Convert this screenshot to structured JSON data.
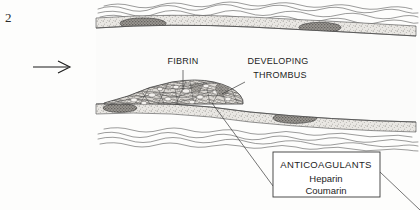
{
  "figure": {
    "number": "2",
    "kind": "blood-vessel-thrombus-diagram"
  },
  "labels": {
    "fibrin": "FIBRIN",
    "developing": "DEVELOPING",
    "thrombus": "THROMBUS"
  },
  "callout": {
    "title": "ANTICOAGULANTS",
    "drug_one": "Heparin",
    "drug_two": "Coumarin"
  },
  "annotations": {
    "flow_arrow": "blood-flow-direction-arrow"
  },
  "colors": {
    "background": "#fdfdfc",
    "ink": "#1d1d1d",
    "line": "#3a3a3a",
    "wall_fill": "#e8e6e2",
    "lumen_fill": "#fbfbfa",
    "thrombus_fill": "#d8d5d0",
    "nucleus_fill": "#8e8b86"
  }
}
